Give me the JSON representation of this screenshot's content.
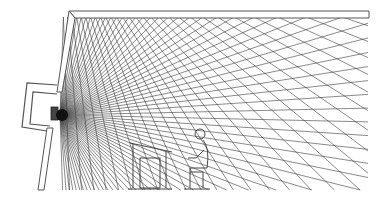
{
  "diagram": {
    "title": "",
    "colors": {
      "background": "#ffffff",
      "lines": "#3a3a3a",
      "wall": "#555555"
    },
    "source": {
      "x": 60,
      "y": 115,
      "label": ""
    },
    "ceiling": {
      "y_outer": 11,
      "y_inner": 17,
      "x_left_outer": 69,
      "x_left_inner": 75,
      "x_right": 368
    },
    "room": {
      "floor_y": 190,
      "right_x": 368
    },
    "rays": {
      "count": 70,
      "angle_start_deg": -88,
      "angle_end_deg": 88
    },
    "elements": [
      {
        "name": "ceiling-wall",
        "type": "double-line wall"
      },
      {
        "name": "left-wall",
        "type": "slanted double-line wall"
      },
      {
        "name": "speaker-alcove",
        "type": "recessed enclosure"
      },
      {
        "name": "loudspeaker-source",
        "type": "sound source"
      },
      {
        "name": "listener-figure",
        "type": "seated person outline"
      },
      {
        "name": "desk-figure",
        "type": "table and chair outline"
      }
    ]
  }
}
